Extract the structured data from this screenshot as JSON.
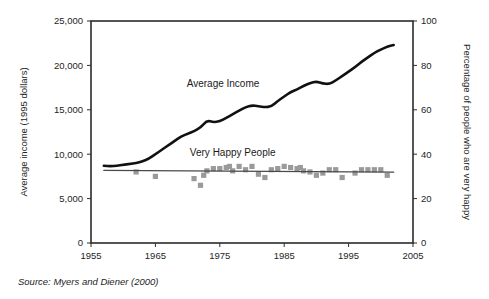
{
  "figure": {
    "source_prefix": "Source:",
    "source_text": "Myers and Diener (2000)"
  },
  "chart_data": {
    "type": "line",
    "title": "",
    "subtitle": "",
    "xlabel": "",
    "ylabel": "Average income (1995 dollars)",
    "y2label": "Percentage of people who are very happy",
    "xlim": [
      1955,
      2005
    ],
    "ylim": [
      0,
      25000
    ],
    "y2lim": [
      0,
      100
    ],
    "xticks": [
      1955,
      1965,
      1975,
      1985,
      1995,
      2005
    ],
    "xticklabels": [
      "1955",
      "1965",
      "1975",
      "1985",
      "1995",
      "2005"
    ],
    "yticks": [
      0,
      5000,
      10000,
      15000,
      20000,
      25000
    ],
    "yticklabels": [
      "0",
      "5,000",
      "10,000",
      "15,000",
      "20,000",
      "25,000"
    ],
    "y2ticks": [
      0,
      20,
      40,
      60,
      80,
      100
    ],
    "y2ticklabels": [
      "0",
      "20",
      "40",
      "60",
      "80",
      "100"
    ],
    "grid": false,
    "legend_position": "inline-annotations",
    "annotations": [
      {
        "text": "Average Income",
        "x": 1975.5,
        "y": 17600
      },
      {
        "text": "Very Happy People",
        "x": 1977.0,
        "y": 9800
      }
    ],
    "series": [
      {
        "name": "Average Income",
        "axis": "left",
        "type": "line",
        "color": "#111111",
        "x": [
          1957,
          1958,
          1959,
          1960,
          1961,
          1962,
          1963,
          1964,
          1965,
          1966,
          1967,
          1968,
          1969,
          1970,
          1971,
          1972,
          1973,
          1974,
          1975,
          1976,
          1977,
          1978,
          1979,
          1980,
          1981,
          1982,
          1983,
          1984,
          1985,
          1986,
          1987,
          1988,
          1989,
          1990,
          1991,
          1992,
          1993,
          1994,
          1995,
          1996,
          1997,
          1998,
          1999,
          2000,
          2001,
          2002
        ],
        "values": [
          8700,
          8650,
          8700,
          8800,
          8900,
          9000,
          9200,
          9500,
          10000,
          10500,
          11000,
          11500,
          12000,
          12300,
          12600,
          13000,
          13800,
          13600,
          13700,
          14100,
          14500,
          14900,
          15300,
          15500,
          15400,
          15300,
          15350,
          16000,
          16500,
          17000,
          17300,
          17700,
          18000,
          18200,
          17950,
          17900,
          18300,
          18800,
          19300,
          19800,
          20400,
          20900,
          21400,
          21800,
          22100,
          22300
        ]
      },
      {
        "name": "Very Happy People",
        "axis": "right",
        "type": "scatter",
        "color": "#9a9a9a",
        "marker": "square",
        "x": [
          1962,
          1965,
          1971,
          1972,
          1972.5,
          1973,
          1974,
          1975,
          1976,
          1976.5,
          1977,
          1978,
          1979,
          1980,
          1981,
          1982,
          1983,
          1984,
          1985,
          1986,
          1987,
          1987.5,
          1988,
          1989,
          1990,
          1991,
          1992,
          1993,
          1994,
          1996,
          1997,
          1998,
          1999,
          2000,
          2001
        ],
        "values": [
          32.0,
          30.0,
          29.0,
          26.0,
          30.5,
          32.5,
          33.5,
          33.5,
          34.0,
          34.5,
          32.5,
          34.5,
          33.0,
          34.5,
          31.0,
          29.5,
          33.0,
          33.5,
          34.5,
          34.0,
          33.5,
          34.0,
          32.5,
          32.0,
          30.5,
          31.5,
          33.0,
          33.0,
          29.5,
          31.5,
          33.0,
          33.0,
          33.0,
          33.0,
          30.5
        ]
      },
      {
        "name": "Very Happy People Trend",
        "axis": "right",
        "type": "line",
        "color": "#4a4a4a",
        "x": [
          1957,
          2002
        ],
        "values": [
          32.7,
          31.9
        ]
      }
    ]
  }
}
